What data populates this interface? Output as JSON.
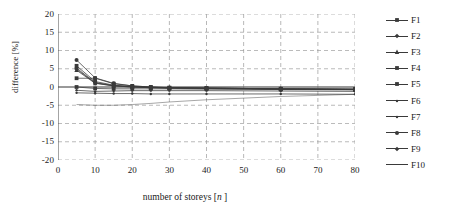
{
  "chart_data": {
    "type": "line",
    "title": "",
    "xlabel": "number of storeys [n]",
    "xlabel_plain": "number of storeys [",
    "xlabel_italic": "n",
    "xlabel_tail": " ]",
    "ylabel": "difference [%]",
    "xlim": [
      0,
      80
    ],
    "ylim": [
      -20,
      20
    ],
    "xticks": [
      0,
      10,
      20,
      30,
      40,
      50,
      60,
      70,
      80
    ],
    "yticks": [
      20,
      15,
      10,
      5,
      0,
      -5,
      -10,
      -15,
      -20
    ],
    "grid": "dashed-gray-both-axes",
    "legend_position": "right",
    "x": [
      5,
      10,
      15,
      20,
      25,
      30,
      40,
      60,
      80
    ],
    "series": [
      {
        "name": "F1",
        "marker": "square",
        "values": [
          0.0,
          -0.4,
          -0.5,
          -0.5,
          -0.5,
          -0.5,
          -0.6,
          -0.7,
          -0.8
        ]
      },
      {
        "name": "F2",
        "marker": "diamond",
        "values": [
          5.2,
          1.2,
          0.4,
          0.1,
          -0.1,
          -0.2,
          -0.3,
          -0.5,
          -0.6
        ]
      },
      {
        "name": "F3",
        "marker": "triangle",
        "values": [
          4.6,
          1.0,
          0.3,
          0.0,
          -0.2,
          -0.3,
          -0.4,
          -0.6,
          -0.7
        ]
      },
      {
        "name": "F4",
        "marker": "square",
        "values": [
          2.4,
          2.4,
          0.9,
          0.3,
          0.0,
          -0.2,
          -0.3,
          -0.5,
          -0.6
        ]
      },
      {
        "name": "F5",
        "marker": "square",
        "values": [
          5.8,
          1.5,
          0.5,
          0.1,
          -0.1,
          -0.2,
          -0.3,
          -0.5,
          -0.6
        ]
      },
      {
        "name": "F6",
        "marker": "dot",
        "values": [
          -1.6,
          -1.7,
          -1.8,
          -1.8,
          -1.9,
          -1.9,
          -1.9,
          -1.9,
          -2.0
        ]
      },
      {
        "name": "F7",
        "marker": "dot",
        "values": [
          -0.9,
          -1.2,
          -1.1,
          -1.0,
          -1.0,
          -1.0,
          -1.0,
          -1.1,
          -1.2
        ]
      },
      {
        "name": "F8",
        "marker": "circle",
        "values": [
          7.4,
          2.5,
          1.0,
          0.3,
          0.0,
          -0.2,
          -0.3,
          -0.5,
          -0.6
        ]
      },
      {
        "name": "F9",
        "marker": "diamond",
        "values": [
          4.9,
          1.1,
          0.3,
          0.0,
          -0.2,
          -0.3,
          -0.4,
          -0.6,
          -0.7
        ]
      },
      {
        "name": "F10",
        "marker": "none",
        "values": [
          -4.8,
          -5.0,
          -5.0,
          -4.8,
          -4.5,
          -4.1,
          -3.5,
          -2.6,
          -2.0
        ]
      }
    ]
  },
  "legend": {
    "items": [
      {
        "label": "F1"
      },
      {
        "label": "F2"
      },
      {
        "label": "F3"
      },
      {
        "label": "F4"
      },
      {
        "label": "F5"
      },
      {
        "label": "F6"
      },
      {
        "label": "F7"
      },
      {
        "label": "F8"
      },
      {
        "label": "F9"
      },
      {
        "label": "F10"
      }
    ]
  },
  "colors": {
    "line": "#3a3a3a",
    "grid": "#9a9a9a",
    "axis": "#4a4a4a",
    "text": "#1a1a1a",
    "background": "#ffffff"
  }
}
